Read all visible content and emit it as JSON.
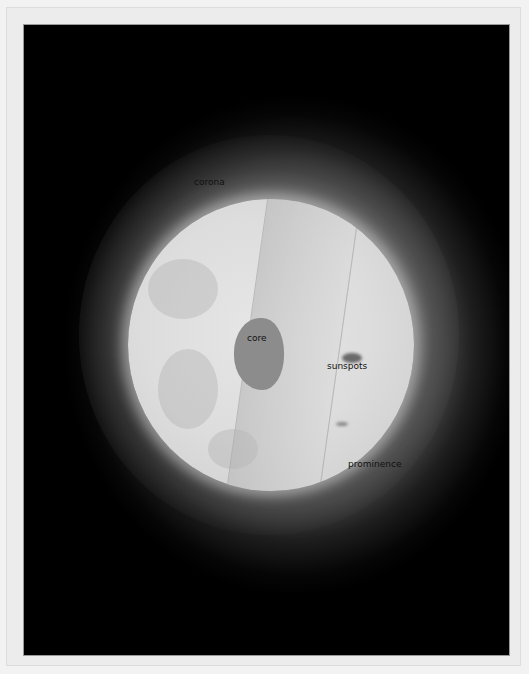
{
  "image": {
    "subject": "Cutaway illustration of the Sun",
    "labels": {
      "corona": "corona",
      "core": "core",
      "sunspots": "sunspots",
      "prominence": "prominence"
    },
    "colors": {
      "background": "#000000",
      "sun_surface": "#dddddd",
      "core": "#8c8c8c",
      "frame": "#ececec"
    }
  }
}
